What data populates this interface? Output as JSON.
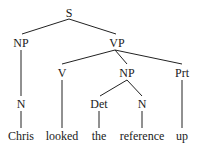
{
  "tree": {
    "nodes": {
      "s": {
        "label": "S",
        "x": 69,
        "y": 17
      },
      "np_subj": {
        "label": "NP",
        "x": 21,
        "y": 47
      },
      "vp": {
        "label": "VP",
        "x": 117,
        "y": 47
      },
      "n_subj": {
        "label": "N",
        "x": 21,
        "y": 108
      },
      "v": {
        "label": "V",
        "x": 62,
        "y": 77
      },
      "np_obj": {
        "label": "NP",
        "x": 127,
        "y": 77
      },
      "prt": {
        "label": "Prt",
        "x": 182,
        "y": 77
      },
      "det": {
        "label": "Det",
        "x": 99,
        "y": 108
      },
      "n_obj": {
        "label": "N",
        "x": 142,
        "y": 108
      }
    },
    "words": [
      {
        "text": "Chris",
        "x": 21
      },
      {
        "text": "looked",
        "x": 62
      },
      {
        "text": "the",
        "x": 99
      },
      {
        "text": "reference",
        "x": 142
      },
      {
        "text": "up",
        "x": 182
      }
    ],
    "word_y": 140
  }
}
